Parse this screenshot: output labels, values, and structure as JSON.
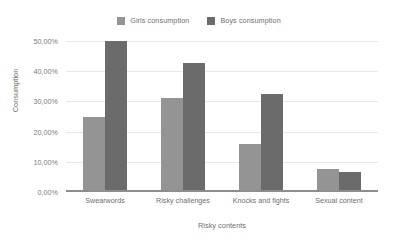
{
  "chart_data": {
    "type": "bar",
    "title": "",
    "xlabel": "Risky contents",
    "ylabel": "Consumption",
    "categories": [
      "Swearwords",
      "Risky challenges",
      "Knocks and fights",
      "Sexual content"
    ],
    "series": [
      {
        "name": "Girls consumption",
        "values": [
          25.0,
          31.0,
          16.0,
          7.5
        ],
        "color": "#949494"
      },
      {
        "name": "Boys consumption",
        "values": [
          50.0,
          42.7,
          32.5,
          6.7
        ],
        "color": "#6b6b6b"
      }
    ],
    "ylim": [
      0,
      50
    ],
    "ytick_values": [
      0,
      10,
      20,
      30,
      40,
      50
    ],
    "ytick_labels": [
      "0,00%",
      "10,00%",
      "20,00%",
      "30,00%",
      "40,00%",
      "50,00%"
    ],
    "grid": true,
    "legend_position": "top-center",
    "value_format": "percent-comma-decimal"
  },
  "legend": {
    "entries": [
      {
        "label": "Girls consumption",
        "color": "#949494"
      },
      {
        "label": "Boys consumption",
        "color": "#6b6b6b"
      }
    ]
  },
  "axes": {
    "y_title": "Consumption",
    "x_title": "Risky contents"
  }
}
